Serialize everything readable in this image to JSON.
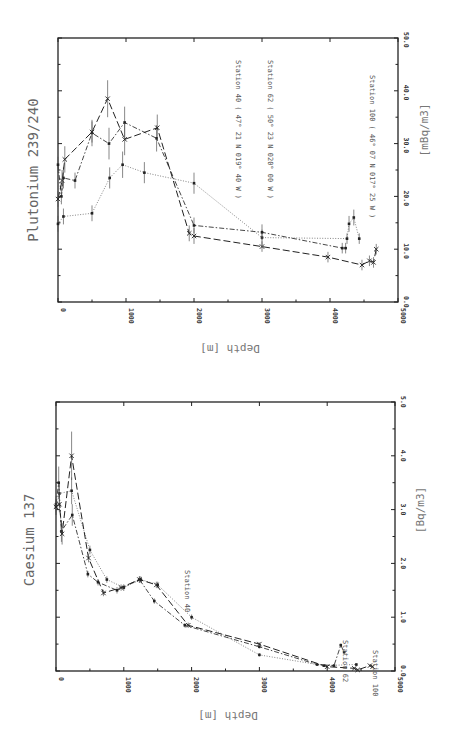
{
  "chart_data": [
    {
      "type": "line",
      "title": "Plutonium 239/240",
      "xlabel": "Depth [m]",
      "ylabel": "[mBq/m3]",
      "xlim": [
        0,
        5000
      ],
      "ylim": [
        0,
        50
      ],
      "x_ticks": [
        "0",
        "1000",
        "2000",
        "3000",
        "4000",
        "5000"
      ],
      "y_ticks": [
        "0.0",
        "10.0",
        "20.0",
        "30.0",
        "40.0",
        "50.0"
      ],
      "orientation": "rotated-90",
      "series": [
        {
          "name": "Station 40",
          "label": "Station 40 ( 47° 21 N 019° 40 W )",
          "marker": "dot",
          "line": "dotted",
          "points": [
            [
              0,
              14.8
            ],
            [
              80,
              16.2
            ],
            [
              500,
              16.8
            ],
            [
              760,
              23.5
            ],
            [
              950,
              26
            ],
            [
              1270,
              24.5
            ],
            [
              2000,
              22.5
            ],
            [
              3000,
              12.2
            ],
            [
              4250,
              12
            ],
            [
              4280,
              14.8
            ],
            [
              4350,
              16
            ],
            [
              4430,
              12
            ]
          ],
          "errors": [
            1.5,
            1.5,
            1.5,
            2,
            2.5,
            2,
            2,
            1.5,
            1,
            1.5,
            1.5,
            1
          ]
        },
        {
          "name": "Station 62",
          "label": "Station 62 ( 50° 23 N 020° 00 W )",
          "marker": "dot",
          "line": "dash-dot",
          "points": [
            [
              0,
              26
            ],
            [
              50,
              20
            ],
            [
              80,
              23.5
            ],
            [
              250,
              23
            ],
            [
              500,
              32
            ],
            [
              750,
              30
            ],
            [
              980,
              34
            ],
            [
              1450,
              31
            ],
            [
              2000,
              14.5
            ],
            [
              3000,
              13.2
            ],
            [
              4180,
              10.2
            ],
            [
              4230,
              10.2
            ]
          ],
          "errors": [
            1.5,
            1.5,
            2,
            1.5,
            2.5,
            3,
            3,
            2.5,
            1.5,
            1.5,
            1,
            1
          ]
        },
        {
          "name": "Station 100",
          "label": "Station 100 ( 46° 07 N 017° 25 W )",
          "marker": "cross",
          "line": "dashed",
          "points": [
            [
              0,
              19.5
            ],
            [
              60,
              23
            ],
            [
              100,
              27
            ],
            [
              500,
              32.2
            ],
            [
              730,
              38.5
            ],
            [
              980,
              30.8
            ],
            [
              1460,
              33
            ],
            [
              1930,
              13
            ],
            [
              2000,
              12.5
            ],
            [
              3000,
              10.5
            ],
            [
              3970,
              8.5
            ],
            [
              4470,
              7
            ],
            [
              4580,
              7.8
            ],
            [
              4640,
              7.5
            ],
            [
              4680,
              10
            ]
          ],
          "errors": [
            1.5,
            2,
            2.5,
            2,
            3.5,
            3,
            2.5,
            1.5,
            1.5,
            1,
            1,
            1,
            1,
            1,
            1
          ]
        }
      ]
    },
    {
      "type": "line",
      "title": "Caesium 137",
      "xlabel": "Depth [m]",
      "ylabel": "[Bq/m3]",
      "xlim": [
        0,
        5000
      ],
      "ylim": [
        0,
        5
      ],
      "x_ticks": [
        "0",
        "1000",
        "2000",
        "3000",
        "4000",
        "5000"
      ],
      "y_ticks": [
        "0.0",
        "1.0",
        "2.0",
        "3.0",
        "4.0",
        "5.0"
      ],
      "orientation": "rotated-90",
      "series": [
        {
          "name": "Station 40",
          "label": "Station 40",
          "marker": "dot",
          "line": "dotted",
          "points": [
            [
              0,
              3.05
            ],
            [
              50,
              3.3
            ],
            [
              230,
              3.35
            ],
            [
              500,
              2.25
            ],
            [
              750,
              1.7
            ],
            [
              1000,
              1.55
            ],
            [
              1250,
              1.7
            ],
            [
              1500,
              1.6
            ],
            [
              2000,
              1.0
            ],
            [
              3000,
              0.3
            ],
            [
              3950,
              0.1
            ],
            [
              4430,
              0.12
            ]
          ],
          "errors": [
            0.15,
            0.2,
            0.25,
            0.08,
            0.06,
            0.06,
            0.06,
            0.06,
            0.05,
            0.03,
            0.02,
            0.02
          ]
        },
        {
          "name": "Station 62",
          "label": "Station 62",
          "marker": "dot",
          "line": "dash-dot",
          "points": [
            [
              0,
              3.1
            ],
            [
              40,
              3.5
            ],
            [
              80,
              2.6
            ],
            [
              240,
              2.9
            ],
            [
              470,
              1.8
            ],
            [
              620,
              1.65
            ],
            [
              900,
              1.5
            ],
            [
              1230,
              1.7
            ],
            [
              1450,
              1.3
            ],
            [
              1900,
              0.85
            ],
            [
              3000,
              0.45
            ],
            [
              3850,
              0.12
            ],
            [
              4100,
              0.1
            ],
            [
              4200,
              0.48
            ],
            [
              4250,
              0.35
            ]
          ],
          "errors": [
            0.15,
            0.3,
            0.2,
            0.2,
            0.06,
            0.06,
            0.06,
            0.06,
            0.05,
            0.04,
            0.03,
            0.02,
            0.02,
            0.03,
            0.03
          ]
        },
        {
          "name": "Station 100",
          "label": "Station 100",
          "marker": "cross",
          "line": "dashed",
          "points": [
            [
              0,
              3.05
            ],
            [
              50,
              3.1
            ],
            [
              90,
              2.55
            ],
            [
              230,
              4.0
            ],
            [
              480,
              2.1
            ],
            [
              700,
              1.45
            ],
            [
              960,
              1.55
            ],
            [
              1230,
              1.7
            ],
            [
              1480,
              1.6
            ],
            [
              1950,
              0.85
            ],
            [
              3000,
              0.5
            ],
            [
              4000,
              0.08
            ],
            [
              4400,
              0.05
            ],
            [
              4450,
              0.02
            ],
            [
              4630,
              0.1
            ],
            [
              4670,
              0.08
            ]
          ],
          "errors": [
            0.15,
            0.15,
            0.2,
            0.45,
            0.08,
            0.06,
            0.06,
            0.06,
            0.06,
            0.05,
            0.03,
            0.02,
            0.02,
            0.02,
            0.02,
            0.02
          ]
        }
      ]
    }
  ]
}
